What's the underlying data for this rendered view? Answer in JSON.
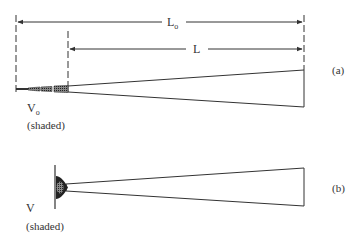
{
  "diagram": {
    "panel_a": {
      "tag": "(a)",
      "dimension_outer": {
        "label": "L",
        "subscript": "o"
      },
      "dimension_inner": {
        "label": "L"
      },
      "volume_label": {
        "text": "V",
        "subscript": "o"
      },
      "volume_note": "(shaded)"
    },
    "panel_b": {
      "tag": "(b)",
      "volume_label": {
        "text": "V"
      },
      "volume_note": "(shaded)"
    },
    "colors": {
      "line": "#333333",
      "shade": "#555555",
      "background": "#ffffff"
    }
  }
}
